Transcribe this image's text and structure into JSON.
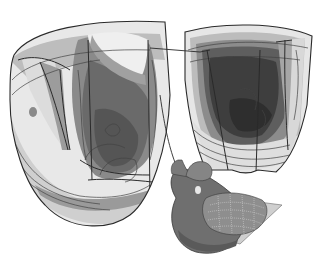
{
  "figure": {
    "background": "#ffffff",
    "palette": {
      "outline": "#2a2a2a",
      "lightest": "#f2f2f2",
      "light": "#d4d4d4",
      "mid": "#a8a8a8",
      "dark": "#6e6e6e",
      "darker": "#4a4a4a",
      "darkest": "#2e2e2e"
    },
    "panels": [
      {
        "name": "left-ventricle-section",
        "label": ""
      },
      {
        "name": "right-ventricle-section",
        "label": ""
      },
      {
        "name": "heart-model-inset",
        "label": ""
      }
    ]
  }
}
